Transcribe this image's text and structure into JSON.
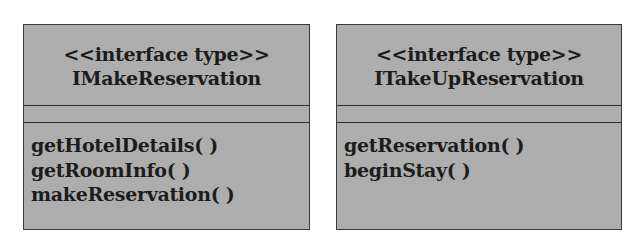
{
  "diagram": {
    "type": "uml-class-diagram",
    "fill_color": "#a9a9a9",
    "border_color": "#3a3a3a",
    "classes": [
      {
        "stereotype": "<<interface type>>",
        "name": "IMakeReservation",
        "attributes": [],
        "operations": [
          "getHotelDetails( )",
          "getRoomInfo( )",
          "makeReservation( )"
        ]
      },
      {
        "stereotype": "<<interface type>>",
        "name": "ITakeUpReservation",
        "attributes": [],
        "operations": [
          "getReservation( )",
          "beginStay( )"
        ]
      }
    ]
  }
}
